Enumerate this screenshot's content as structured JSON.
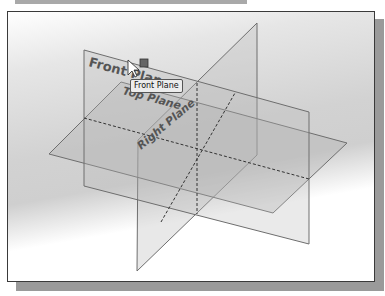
{
  "labels": {
    "front_plane": "Front Plane",
    "top_plane": "Top Plane",
    "right_plane": "Right Plane"
  },
  "tooltip": {
    "text": "Front Plane"
  },
  "cursor": {
    "icon": "arrow-cursor-icon",
    "badge": "plane-select-icon"
  },
  "colors": {
    "plane_edge": "#6e6e6e",
    "plane_fill": "#b4b4b4",
    "label_text": "#555555",
    "dashed_line": "#333333",
    "frame_border": "#3a3a3a",
    "shadow": "#9a9a9a"
  }
}
